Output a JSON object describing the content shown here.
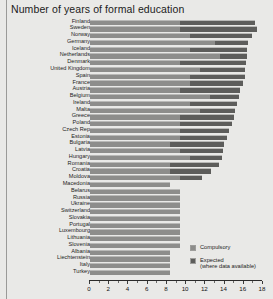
{
  "chart_data": {
    "type": "bar",
    "orientation": "horizontal",
    "stacked": true,
    "title": "Number of years of formal education",
    "xlabel": "",
    "ylabel": "",
    "xlim": [
      0,
      18
    ],
    "xticks": [
      0,
      2,
      4,
      6,
      8,
      10,
      12,
      14,
      16,
      18
    ],
    "xtick_labels": [
      "0",
      "2",
      "4",
      "6",
      "8",
      "10",
      "12",
      "14",
      "16",
      "18"
    ],
    "grid": false,
    "legend_position": "inside-bottom-right",
    "legend": [
      {
        "name": "Compulsory",
        "color": "#8d8d8b"
      },
      {
        "name": "Expected\n(where data available)",
        "color": "#5d5d5b"
      }
    ],
    "series": [
      {
        "name": "Compulsory",
        "color": "#8d8d8b"
      },
      {
        "name": "Expected (where data available)",
        "color": "#5d5d5b"
      }
    ],
    "categories": [
      "Finland",
      "Sweden",
      "Norway",
      "Germany",
      "Iceland",
      "Netherlands",
      "Denmark",
      "United Kingdom",
      "Spain",
      "France",
      "Austria",
      "Belgium",
      "Ireland",
      "Malta",
      "Greece",
      "Poland",
      "Czech Rep",
      "Estonia",
      "Bulgaria",
      "Latvia",
      "Hungary",
      "Romania",
      "Croatia",
      "Moldova",
      "Macedonia",
      "Belarus",
      "Russia",
      "Ukraine",
      "Switzerland",
      "Slovakia",
      "Portugal",
      "Luxembourg",
      "Lithuania",
      "Slovenia",
      "Albania",
      "Liechtenstein",
      "Italy",
      "Turkey"
    ],
    "rows": [
      {
        "country": "Finland",
        "compulsory": 9.0,
        "expected": 16.5
      },
      {
        "country": "Sweden",
        "compulsory": 9.0,
        "expected": 16.7
      },
      {
        "country": "Norway",
        "compulsory": 10.0,
        "expected": 16.2
      },
      {
        "country": "Germany",
        "compulsory": 12.5,
        "expected": 15.8
      },
      {
        "country": "Iceland",
        "compulsory": 10.0,
        "expected": 15.7
      },
      {
        "country": "Netherlands",
        "compulsory": 13.0,
        "expected": 15.7
      },
      {
        "country": "Denmark",
        "compulsory": 9.0,
        "expected": 15.6
      },
      {
        "country": "United Kingdom",
        "compulsory": 11.0,
        "expected": 15.5
      },
      {
        "country": "Spain",
        "compulsory": 10.0,
        "expected": 15.5
      },
      {
        "country": "France",
        "compulsory": 10.0,
        "expected": 15.3
      },
      {
        "country": "Austria",
        "compulsory": 9.0,
        "expected": 15.0
      },
      {
        "country": "Belgium",
        "compulsory": 12.0,
        "expected": 14.9
      },
      {
        "country": "Ireland",
        "compulsory": 10.0,
        "expected": 14.7
      },
      {
        "country": "Malta",
        "compulsory": 11.0,
        "expected": 14.5
      },
      {
        "country": "Greece",
        "compulsory": 9.0,
        "expected": 14.4
      },
      {
        "country": "Poland",
        "compulsory": 9.0,
        "expected": 14.2
      },
      {
        "country": "Czech Rep",
        "compulsory": 9.0,
        "expected": 13.9
      },
      {
        "country": "Estonia",
        "compulsory": 9.0,
        "expected": 13.7
      },
      {
        "country": "Bulgaria",
        "compulsory": 8.0,
        "expected": 13.4
      },
      {
        "country": "Latvia",
        "compulsory": 9.0,
        "expected": 13.3
      },
      {
        "country": "Hungary",
        "compulsory": 10.0,
        "expected": 13.2
      },
      {
        "country": "Romania",
        "compulsory": 8.0,
        "expected": 12.9
      },
      {
        "country": "Croatia",
        "compulsory": 8.0,
        "expected": 12.1
      },
      {
        "country": "Moldova",
        "compulsory": 9.0,
        "expected": 11.2
      },
      {
        "country": "Macedonia",
        "compulsory": 8.0,
        "expected": null
      },
      {
        "country": "Belarus",
        "compulsory": 9.0,
        "expected": null
      },
      {
        "country": "Russia",
        "compulsory": 9.0,
        "expected": null
      },
      {
        "country": "Ukraine",
        "compulsory": 9.0,
        "expected": null
      },
      {
        "country": "Switzerland",
        "compulsory": 9.0,
        "expected": null
      },
      {
        "country": "Slovakia",
        "compulsory": 9.0,
        "expected": null
      },
      {
        "country": "Portugal",
        "compulsory": 9.0,
        "expected": null
      },
      {
        "country": "Luxembourg",
        "compulsory": 9.0,
        "expected": null
      },
      {
        "country": "Lithuania",
        "compulsory": 9.0,
        "expected": null
      },
      {
        "country": "Slovenia",
        "compulsory": 9.0,
        "expected": null
      },
      {
        "country": "Albania",
        "compulsory": 8.0,
        "expected": null
      },
      {
        "country": "Liechtenstein",
        "compulsory": 8.0,
        "expected": null
      },
      {
        "country": "Italy",
        "compulsory": 8.0,
        "expected": null
      },
      {
        "country": "Turkey",
        "compulsory": 8.0,
        "expected": null
      }
    ]
  }
}
